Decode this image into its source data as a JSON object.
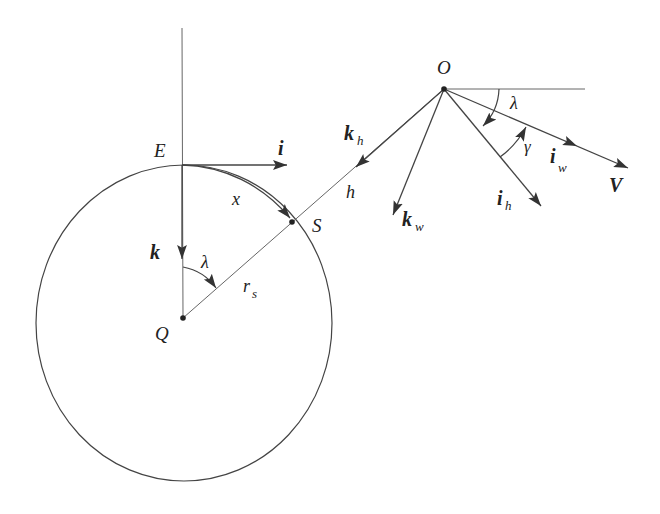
{
  "diagram": {
    "type": "geometry-vector-diagram",
    "stroke_color": "#333333",
    "thin_color": "#666666",
    "points": {
      "O": {
        "label": "O",
        "x": 444,
        "y": 89
      },
      "E": {
        "label": "E",
        "x": 182,
        "y": 165
      },
      "S": {
        "label": "S",
        "x": 292,
        "y": 222
      },
      "Q": {
        "label": "Q",
        "x": 183,
        "y": 318
      }
    },
    "circle": {
      "cx": 184,
      "cy": 323,
      "rx": 148,
      "ry": 158
    },
    "labels": {
      "O": "O",
      "E": "E",
      "S": "S",
      "Q": "Q",
      "i": "i",
      "k": "k",
      "x": "x",
      "h": "h",
      "r": "r",
      "r_sub": "s",
      "lambda_top": "λ",
      "lambda_center": "λ",
      "gamma": "γ",
      "kh": "k",
      "kh_sub": "h",
      "kw": "k",
      "kw_sub": "w",
      "ih": "i",
      "ih_sub": "h",
      "iw": "i",
      "iw_sub": "w",
      "V": "V"
    }
  }
}
